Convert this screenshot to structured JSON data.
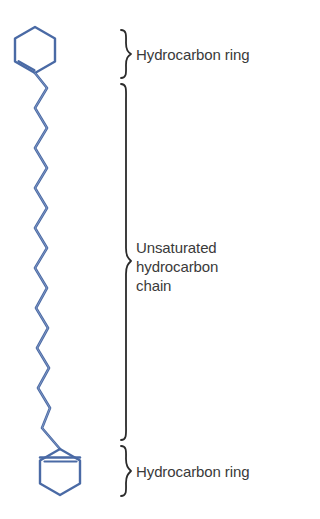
{
  "figure": {
    "background_color": "#ffffff",
    "width": 320,
    "height": 519
  },
  "molecule": {
    "name": "unsaturated-hydrocarbon-with-terminal-rings",
    "bond_color": "#4a6aa5",
    "bond_highlight_color": "#7f95c4",
    "bond_width": 2.4,
    "parts": [
      {
        "name": "top-hydrocarbon-ring",
        "shape": "hexagon",
        "center_x": 35,
        "center_y": 50,
        "radius": 23,
        "double_bond_edge": "bottom-right"
      },
      {
        "name": "unsaturated-hydrocarbon-chain",
        "shape": "zigzag",
        "segments": 19,
        "start_y": 68,
        "end_y": 452,
        "amplitude": 9
      },
      {
        "name": "bottom-hydrocarbon-ring",
        "shape": "hexagon",
        "center_x": 60,
        "center_y": 472,
        "radius": 23,
        "double_bond_edge": "top-right"
      }
    ]
  },
  "braces": {
    "color": "#2b2b2b",
    "stroke_width": 1.8,
    "items": [
      {
        "name": "brace-top-ring",
        "x": 120,
        "y_start": 30,
        "y_end": 79
      },
      {
        "name": "brace-chain",
        "x": 120,
        "y_start": 84,
        "y_end": 440
      },
      {
        "name": "brace-bottom-ring",
        "x": 120,
        "y_start": 446,
        "y_end": 500
      }
    ]
  },
  "labels": {
    "ring_top": "Hydrocarbon ring",
    "chain_line1": "Unsaturated",
    "chain_line2": "hydrocarbon",
    "chain_line3": "chain",
    "ring_bottom": "Hydrocarbon ring"
  }
}
